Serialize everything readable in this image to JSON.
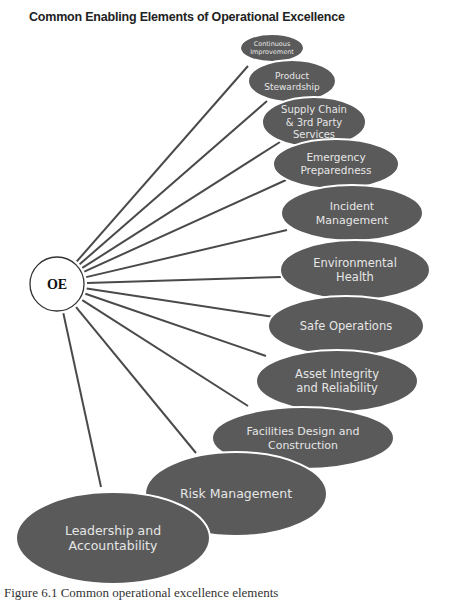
{
  "title": "Common Enabling Elements of Operational Excellence",
  "center": {
    "label": "OE",
    "cx": 57,
    "cy": 284,
    "r": 27
  },
  "colors": {
    "node_fill": "#5a5a5a",
    "node_text": "#e6e6e6",
    "line": "#4a4a4a",
    "node_outline": "#ffffff"
  },
  "elements": [
    {
      "lines": [
        "Continuous",
        "Improvement"
      ],
      "cx": 272,
      "cy": 48,
      "rx": 32,
      "ry": 14,
      "fs": 6.5,
      "lx": 248,
      "ly": 66
    },
    {
      "lines": [
        "Product",
        "Stewardship"
      ],
      "cx": 292,
      "cy": 81,
      "rx": 44,
      "ry": 21,
      "fs": 9,
      "lx": 267,
      "ly": 101
    },
    {
      "lines": [
        "Supply Chain",
        "& 3rd Party",
        "Services"
      ],
      "cx": 314,
      "cy": 122,
      "rx": 52,
      "ry": 25,
      "fs": 10,
      "lx": 280,
      "ly": 142
    },
    {
      "lines": [
        "Emergency",
        "Preparedness"
      ],
      "cx": 336,
      "cy": 164,
      "rx": 63,
      "ry": 25,
      "fs": 10.5,
      "lx": 286,
      "ly": 180
    },
    {
      "lines": [
        "Incident",
        "Management"
      ],
      "cx": 352,
      "cy": 213,
      "rx": 71,
      "ry": 28,
      "fs": 11,
      "lx": 287,
      "ly": 230
    },
    {
      "lines": [
        "Environmental",
        "Health"
      ],
      "cx": 355,
      "cy": 270,
      "rx": 75,
      "ry": 30,
      "fs": 11.5,
      "lx": 281,
      "ly": 277
    },
    {
      "lines": [
        "Safe Operations"
      ],
      "cx": 346,
      "cy": 326,
      "rx": 78,
      "ry": 30,
      "fs": 11.5,
      "lx": 274,
      "ly": 317
    },
    {
      "lines": [
        "Asset Integrity",
        "and Reliability"
      ],
      "cx": 337,
      "cy": 381,
      "rx": 81,
      "ry": 31,
      "fs": 11.5,
      "lx": 266,
      "ly": 356
    },
    {
      "lines": [
        "Facilities Design and",
        "Construction"
      ],
      "cx": 303,
      "cy": 438,
      "rx": 91,
      "ry": 31,
      "fs": 11,
      "lx": 248,
      "ly": 406
    },
    {
      "lines": [
        "Risk Management"
      ],
      "cx": 236,
      "cy": 494,
      "rx": 91,
      "ry": 42,
      "fs": 12.5,
      "lx": 196,
      "ly": 453
    },
    {
      "lines": [
        "Leadership and",
        "Accountability"
      ],
      "cx": 113,
      "cy": 538,
      "rx": 97,
      "ry": 46,
      "fs": 12.5,
      "lx": 101,
      "ly": 487
    }
  ],
  "caption": "Figure 6.1 Common operational excellence elements"
}
